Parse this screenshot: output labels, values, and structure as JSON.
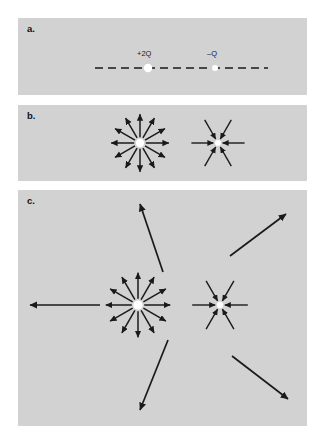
{
  "figure": {
    "background_color": "#ffffff",
    "panel_color": "#d2d2d2",
    "ink_color": "#1a1a1a",
    "charge_color": "#ffffff"
  },
  "panels": [
    {
      "id": "a",
      "label": "a.",
      "description": "Two point charges on a dashed horizontal axis",
      "charges": [
        {
          "name": "positive-charge",
          "label": "+2Q",
          "sign": "positive",
          "magnitude": "2Q",
          "x": 148,
          "y": 68,
          "radius": 4.2
        },
        {
          "name": "negative-charge",
          "label": "–Q",
          "sign": "negative",
          "magnitude": "Q",
          "x": 215,
          "y": 68,
          "radius": 3.0
        }
      ],
      "axis": {
        "type": "dashed-line",
        "x_start": 95,
        "x_end": 268,
        "y": 68
      }
    },
    {
      "id": "b",
      "label": "b.",
      "description": "Field vectors immediately around each charge",
      "charges": [
        {
          "name": "positive-charge",
          "sign": "positive",
          "x": 140,
          "y": 143,
          "radius": 4.2,
          "field_lines": 12,
          "direction": "outward",
          "arrow_length": 23
        },
        {
          "name": "negative-charge",
          "sign": "negative",
          "x": 218,
          "y": 143,
          "radius": 3.0,
          "field_lines": 6,
          "direction": "inward",
          "arrow_length": 22
        }
      ]
    },
    {
      "id": "c",
      "label": "c.",
      "description": "Same charges with long outer field lines extending across the region",
      "charges": [
        {
          "name": "positive-charge",
          "sign": "positive",
          "x": 138,
          "y": 305,
          "radius": 4.6,
          "field_lines": 12,
          "direction": "outward",
          "arrow_length": 26
        },
        {
          "name": "negative-charge",
          "sign": "negative",
          "x": 220,
          "y": 305,
          "radius": 3.2,
          "field_lines": 6,
          "direction": "inward",
          "arrow_length": 23
        }
      ],
      "long_field_lines": [
        {
          "name": "field-line-left",
          "x1": 100,
          "y1": 305,
          "x2": 30,
          "y2": 305
        },
        {
          "name": "field-line-upper-left",
          "x1": 163,
          "y1": 272,
          "x2": 140,
          "y2": 204
        },
        {
          "name": "field-line-lower-left",
          "x1": 168,
          "y1": 340,
          "x2": 140,
          "y2": 410
        },
        {
          "name": "field-line-upper-right",
          "x1": 230,
          "y1": 256,
          "x2": 286,
          "y2": 214
        },
        {
          "name": "field-line-lower-right",
          "x1": 232,
          "y1": 356,
          "x2": 288,
          "y2": 399
        }
      ]
    }
  ]
}
